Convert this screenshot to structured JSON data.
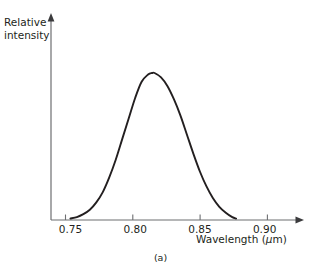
{
  "figure": {
    "caption": "(a)",
    "y_axis_title_line1": "Relative",
    "y_axis_title_line2": "intensity",
    "x_axis_title_text": "Wavelength (",
    "x_axis_title_mu": "μ",
    "x_axis_title_tail": "m)",
    "x_axis_title_full": "Wavelength (μm)"
  },
  "colors": {
    "curve": "#231f20",
    "axis": "#6d6e71",
    "background": "#ffffff",
    "text": "#231f20"
  },
  "chart_data": {
    "type": "line",
    "title": "(a)",
    "xlabel": "Wavelength (μm)",
    "ylabel": "Relative intensity",
    "xlim": [
      0.735,
      0.925
    ],
    "ylim": [
      0,
      1.08
    ],
    "grid": false,
    "legend": false,
    "xticks": [
      0.75,
      0.8,
      0.85,
      0.9
    ],
    "xtick_labels": [
      "0.75",
      "0.80",
      "0.85",
      "0.90"
    ],
    "yticks": [],
    "ytick_labels": [],
    "annotations": [],
    "peak_wavelength_um": 0.813,
    "fwhm_um": 0.044,
    "x": [
      0.75,
      0.755,
      0.76,
      0.765,
      0.77,
      0.775,
      0.78,
      0.785,
      0.79,
      0.795,
      0.8,
      0.805,
      0.81,
      0.813,
      0.815,
      0.82,
      0.825,
      0.83,
      0.835,
      0.84,
      0.845,
      0.85,
      0.855,
      0.86,
      0.865,
      0.87,
      0.875,
      0.878
    ],
    "y": [
      0.01,
      0.02,
      0.04,
      0.07,
      0.12,
      0.19,
      0.29,
      0.41,
      0.55,
      0.69,
      0.83,
      0.94,
      0.99,
      1.0,
      1.0,
      0.97,
      0.91,
      0.82,
      0.71,
      0.58,
      0.45,
      0.33,
      0.23,
      0.15,
      0.09,
      0.05,
      0.02,
      0.01
    ]
  }
}
